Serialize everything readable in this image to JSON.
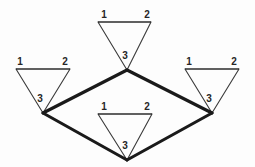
{
  "diagram": {
    "background_color": "#fdfdfd",
    "thin_edge_color": "#3a3a3a",
    "thick_edge_color": "#1a1a1a",
    "label_color": "#262626",
    "triangles": [
      {
        "id": "top",
        "name": "top-triangle",
        "labels": {
          "v1": "1",
          "v2": "2",
          "v3": "3"
        },
        "label_positions": {
          "v1": {
            "x": 104,
            "y": 15
          },
          "v2": {
            "x": 147,
            "y": 15
          },
          "v3": {
            "x": 125,
            "y": 56
          }
        },
        "geometry": {
          "top_left": {
            "x": 98,
            "y": 22
          },
          "top_right": {
            "x": 151,
            "y": 22
          },
          "apex": {
            "x": 127,
            "y": 70
          }
        }
      },
      {
        "id": "left",
        "name": "left-triangle",
        "labels": {
          "v1": "1",
          "v2": "2",
          "v3": "3"
        },
        "label_positions": {
          "v1": {
            "x": 20,
            "y": 62
          },
          "v2": {
            "x": 65,
            "y": 62
          },
          "v3": {
            "x": 40,
            "y": 99
          }
        },
        "geometry": {
          "top_left": {
            "x": 16,
            "y": 69
          },
          "top_right": {
            "x": 70,
            "y": 69
          },
          "apex": {
            "x": 43,
            "y": 113
          }
        }
      },
      {
        "id": "right",
        "name": "right-triangle",
        "labels": {
          "v1": "1",
          "v2": "2",
          "v3": "3"
        },
        "label_positions": {
          "v1": {
            "x": 189,
            "y": 62
          },
          "v2": {
            "x": 234,
            "y": 62
          },
          "v3": {
            "x": 209,
            "y": 99
          }
        },
        "geometry": {
          "top_left": {
            "x": 185,
            "y": 69
          },
          "top_right": {
            "x": 239,
            "y": 69
          },
          "apex": {
            "x": 212,
            "y": 113
          }
        }
      },
      {
        "id": "bottom",
        "name": "bottom-triangle",
        "labels": {
          "v1": "1",
          "v2": "2",
          "v3": "3"
        },
        "label_positions": {
          "v1": {
            "x": 104,
            "y": 107
          },
          "v2": {
            "x": 147,
            "y": 107
          },
          "v3": {
            "x": 125,
            "y": 146
          }
        },
        "geometry": {
          "top_left": {
            "x": 98,
            "y": 114
          },
          "top_right": {
            "x": 152,
            "y": 114
          },
          "apex": {
            "x": 127,
            "y": 160
          }
        }
      }
    ],
    "thick_edges": [
      {
        "name": "edge-left-to-center",
        "from": {
          "x": 43,
          "y": 113
        },
        "to": {
          "x": 127,
          "y": 70
        }
      },
      {
        "name": "edge-center-to-right",
        "from": {
          "x": 127,
          "y": 70
        },
        "to": {
          "x": 212,
          "y": 113
        }
      },
      {
        "name": "edge-left-to-bottom",
        "from": {
          "x": 43,
          "y": 113
        },
        "to": {
          "x": 127,
          "y": 160
        }
      },
      {
        "name": "edge-bottom-to-right",
        "from": {
          "x": 127,
          "y": 160
        },
        "to": {
          "x": 212,
          "y": 113
        }
      }
    ]
  }
}
